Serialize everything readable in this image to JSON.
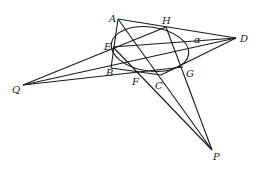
{
  "diagram": {
    "type": "projective-geometry",
    "points": [
      "A",
      "B",
      "C",
      "D",
      "E",
      "F",
      "G",
      "H",
      "P",
      "Q"
    ],
    "labels": {
      "A": "A",
      "B": "B",
      "C": "C",
      "D": "D",
      "E": "E",
      "F": "F",
      "G": "G",
      "H": "H",
      "P": "P",
      "Q": "Q",
      "alpha": "α"
    },
    "segments": [
      [
        "A",
        "B"
      ],
      [
        "A",
        "D"
      ],
      [
        "B",
        "C"
      ],
      [
        "C",
        "D"
      ],
      [
        "Q",
        "H"
      ],
      [
        "Q",
        "D"
      ],
      [
        "Q",
        "G"
      ],
      [
        "A",
        "P"
      ],
      [
        "E",
        "P"
      ],
      [
        "H",
        "P"
      ],
      [
        "E",
        "D"
      ]
    ],
    "conic": {
      "name": "alpha",
      "tangent_points": [
        "E",
        "H",
        "G",
        "F"
      ]
    },
    "color": "#1a1a1a"
  }
}
